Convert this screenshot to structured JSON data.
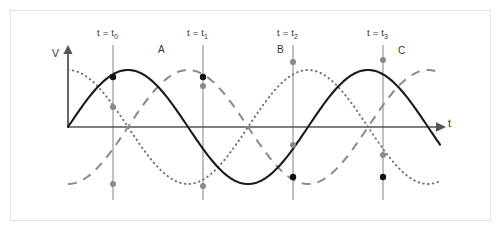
{
  "figure": {
    "axes": {
      "y_axis_label": "V",
      "x_axis_label": "t",
      "origin_px": [
        68,
        127
      ],
      "x_axis_end_px": [
        440,
        127
      ],
      "y_axis_top_px": [
        68,
        50
      ]
    },
    "time_markers": [
      {
        "id": "t0",
        "label_prefix": "t = t",
        "label_sub": "0",
        "x_px": 113
      },
      {
        "id": "t1",
        "label_prefix": "t = t",
        "label_sub": "1",
        "x_px": 203
      },
      {
        "id": "t2",
        "label_prefix": "t = t",
        "label_sub": "2",
        "x_px": 293
      },
      {
        "id": "t3",
        "label_prefix": "t = t",
        "label_sub": "3",
        "x_px": 383
      }
    ],
    "curve_labels": [
      {
        "name": "A",
        "text": "A",
        "x_px": 158,
        "y_px": 51
      },
      {
        "name": "B",
        "text": "B",
        "x_px": 277,
        "y_px": 51
      },
      {
        "name": "C",
        "text": "C",
        "x_px": 398,
        "y_px": 52
      }
    ],
    "colors": {
      "curve_a": "#1a1a1a",
      "curve_b": "#8a8a8a",
      "curve_c": "#6e6e6e",
      "axis": "#555555",
      "gridline": "#777777",
      "marker_dark": "#111111",
      "marker_gray": "#8a8a8a",
      "frame_border": "#e2e2e2",
      "background": "#ffffff"
    }
  },
  "chart_data": {
    "type": "line",
    "title": "",
    "xlabel": "t",
    "ylabel": "V",
    "grid": true,
    "legend": "inline-curve-labels",
    "x_domain_px": [
      68,
      440
    ],
    "y_zero_px": 127,
    "amplitude_px": 57,
    "period_px": 240,
    "xlim": [
      0,
      1.55
    ],
    "ylim": [
      -1,
      1
    ],
    "x_tick_labels": [
      "t = t0",
      "t = t1",
      "t = t2",
      "t = t3"
    ],
    "x_tick_positions_periods": [
      0.1875,
      0.5625,
      0.9375,
      1.3125
    ],
    "series": [
      {
        "name": "A",
        "style": "solid",
        "color": "#1a1a1a",
        "form": "sin",
        "phase_deg": 0,
        "amplitude": 1,
        "values_at_markers": [
          0.87,
          0.87,
          -0.87,
          -0.87
        ],
        "description": "A = sin(2*pi*t/T)"
      },
      {
        "name": "B",
        "style": "dashed",
        "color": "#8a8a8a",
        "form": "-cos",
        "phase_deg": 180,
        "amplitude": 1,
        "values_at_markers": [
          -0.87,
          0.5,
          0.87,
          -0.5
        ],
        "description": "B = -cos(2*pi*t/T) shifted"
      },
      {
        "name": "C",
        "style": "dotted",
        "color": "#6e6e6e",
        "form": "cos",
        "phase_deg": 0,
        "amplitude": 1,
        "values_at_markers": [
          0.5,
          -0.87,
          -0.5,
          0.87
        ],
        "description": "C = cos(2*pi*t/T)"
      }
    ],
    "markers": [
      {
        "series": "A",
        "marker_x_px": 113,
        "marker_y_px": 77,
        "fill": "#111111"
      },
      {
        "series": "A",
        "marker_x_px": 203,
        "marker_y_px": 77,
        "fill": "#111111"
      },
      {
        "series": "A",
        "marker_x_px": 293,
        "marker_y_px": 177,
        "fill": "#111111"
      },
      {
        "series": "A",
        "marker_x_px": 383,
        "marker_y_px": 177,
        "fill": "#111111"
      },
      {
        "series": "B",
        "marker_x_px": 113,
        "marker_y_px": 184,
        "fill": "#8a8a8a"
      },
      {
        "series": "B",
        "marker_x_px": 203,
        "marker_y_px": 86,
        "fill": "#8a8a8a"
      },
      {
        "series": "B",
        "marker_x_px": 293,
        "marker_y_px": 62,
        "fill": "#8a8a8a"
      },
      {
        "series": "B",
        "marker_x_px": 383,
        "marker_y_px": 155,
        "fill": "#8a8a8a"
      },
      {
        "series": "C",
        "marker_x_px": 113,
        "marker_y_px": 107,
        "fill": "#8a8a8a"
      },
      {
        "series": "C",
        "marker_x_px": 203,
        "marker_y_px": 186,
        "fill": "#8a8a8a"
      },
      {
        "series": "C",
        "marker_x_px": 293,
        "marker_y_px": 145,
        "fill": "#8a8a8a"
      },
      {
        "series": "C",
        "marker_x_px": 383,
        "marker_y_px": 60,
        "fill": "#8a8a8a"
      }
    ]
  }
}
